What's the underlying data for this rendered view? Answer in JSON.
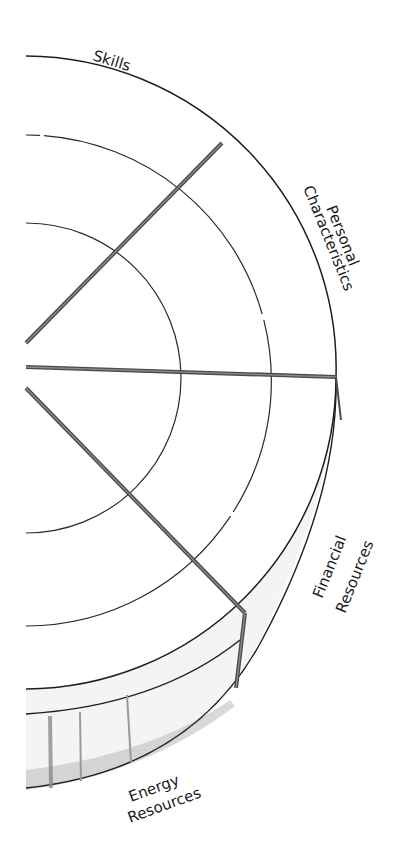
{
  "diagram": {
    "type": "wheel-segment-diagram",
    "segments": [
      {
        "id": "skills",
        "label": "Skills"
      },
      {
        "id": "personal",
        "label_line1": "Personal",
        "label_line2": "Characteristics"
      },
      {
        "id": "financial",
        "label_line1": "Financial",
        "label_line2": "Resources"
      },
      {
        "id": "energy",
        "label_line1": "Energy",
        "label_line2": "Resources"
      }
    ],
    "rings": 3,
    "colors": {
      "line": "#1e1e1e",
      "spoke": "#4a4a4a",
      "band_shade": "#b9b9b9",
      "background": "#ffffff"
    }
  }
}
